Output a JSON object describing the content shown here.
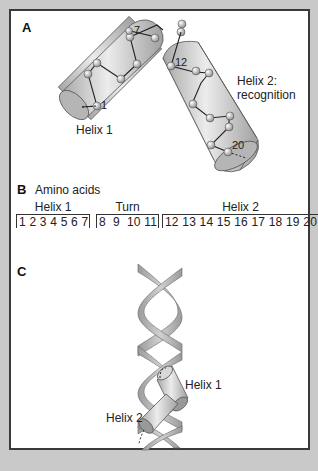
{
  "panels": {
    "a": {
      "letter": "A",
      "helix1_label": "Helix 1",
      "helix2_label_line1": "Helix 2:",
      "helix2_label_line2": "recognition",
      "residue_labels": [
        "1",
        "7",
        "12",
        "20"
      ]
    },
    "b": {
      "letter": "B",
      "title": "Amino acids",
      "groups": [
        {
          "name": "Helix 1",
          "residues": "1 2 3 4 5 6 7"
        },
        {
          "name": "Turn",
          "residues": "8  9  10 11"
        },
        {
          "name": "Helix 2",
          "residues": "12 13 14 15 16 17 18 19 20"
        }
      ]
    },
    "c": {
      "letter": "C",
      "helix1_label": "Helix 1",
      "helix2_label": "Helix 2"
    }
  },
  "colors": {
    "background": "#c9c9c9",
    "panel": "#ffffff",
    "border": "#3a3a3a",
    "cylinder": "#c4c4c4",
    "ribbon": "#b8b8b8"
  }
}
